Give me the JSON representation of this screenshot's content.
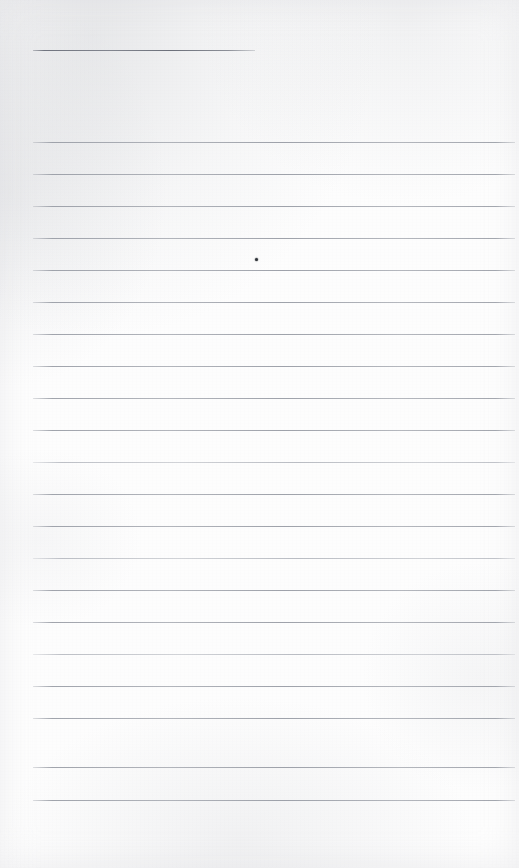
{
  "page": {
    "type": "ruled-notebook-page",
    "width": 519,
    "height": 868,
    "paper_color": "#fdfdfd",
    "rule_color": "#969aa3",
    "header_rule_color": "#6a6e79",
    "mark_color": "#2e3238",
    "content_text": "",
    "is_blank": true
  },
  "header_rule": {
    "label": "header underline",
    "x": 33,
    "y": 50,
    "width": 222
  },
  "rules": {
    "label": "ruled writing lines",
    "left": 33,
    "right": 515,
    "width": 482,
    "spacing": 32,
    "first_y": 142,
    "count": 21,
    "y_positions": [
      142,
      174,
      206,
      238,
      270,
      302,
      334,
      366,
      398,
      430,
      462,
      494,
      526,
      558,
      590,
      622,
      654,
      686,
      718,
      750,
      782,
      800
    ],
    "items": [
      {
        "y": 142,
        "weight": "normal"
      },
      {
        "y": 174,
        "weight": "normal"
      },
      {
        "y": 206,
        "weight": "normal"
      },
      {
        "y": 238,
        "weight": "normal"
      },
      {
        "y": 270,
        "weight": "normal"
      },
      {
        "y": 302,
        "weight": "normal"
      },
      {
        "y": 334,
        "weight": "normal"
      },
      {
        "y": 366,
        "weight": "normal"
      },
      {
        "y": 398,
        "weight": "normal"
      },
      {
        "y": 430,
        "weight": "normal"
      },
      {
        "y": 462,
        "weight": "faint"
      },
      {
        "y": 494,
        "weight": "normal"
      },
      {
        "y": 526,
        "weight": "normal"
      },
      {
        "y": 558,
        "weight": "faint"
      },
      {
        "y": 590,
        "weight": "normal"
      },
      {
        "y": 622,
        "weight": "normal"
      },
      {
        "y": 654,
        "weight": "faint"
      },
      {
        "y": 686,
        "weight": "normal"
      },
      {
        "y": 718,
        "weight": "normal"
      },
      {
        "y": 767,
        "weight": "normal"
      },
      {
        "y": 800,
        "weight": "normal"
      }
    ]
  },
  "marks": [
    {
      "name": "pen-dot",
      "x": 255,
      "y": 258,
      "size": 3
    }
  ]
}
